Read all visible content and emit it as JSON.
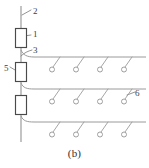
{
  "figure": {
    "caption": "(b)",
    "type": "schematic-line-diagram",
    "colors": {
      "line": "#9a9a9a",
      "valve_outline": "#4a4a4a",
      "label_text": "#3d3d3d",
      "background": "#ffffff"
    },
    "labels": [
      {
        "id": "2",
        "text": "2",
        "refers_to": "main-vertical-pipe-top"
      },
      {
        "id": "1",
        "text": "1",
        "refers_to": "upper-valve-box"
      },
      {
        "id": "3",
        "text": "3",
        "refers_to": "upper-branch-connection"
      },
      {
        "id": "5",
        "text": "5",
        "refers_to": "middle-valve-box"
      },
      {
        "id": "6",
        "text": "6",
        "refers_to": "emitter-hook"
      }
    ],
    "trunk": {
      "name": "main-vertical-line",
      "x": 21,
      "y_top": 6,
      "y_bottom": 142
    },
    "valves": [
      {
        "name": "valve-1",
        "x": 15,
        "y": 28,
        "width": 11,
        "height": 19
      },
      {
        "name": "valve-5",
        "x": 15,
        "y": 62,
        "width": 11,
        "height": 19
      },
      {
        "name": "valve-3rd",
        "x": 15,
        "y": 95,
        "width": 11,
        "height": 19
      }
    ],
    "branches": [
      {
        "name": "branch-upper",
        "y": 57,
        "x_start": 21,
        "x_end": 146,
        "emitter_count": 4,
        "emitters_x": [
          55,
          79,
          103,
          127
        ]
      },
      {
        "name": "branch-middle",
        "y": 89,
        "x_start": 21,
        "x_end": 146,
        "emitter_count": 4,
        "emitters_x": [
          55,
          79,
          103,
          127
        ]
      },
      {
        "name": "branch-lower",
        "y": 122,
        "x_start": 21,
        "x_end": 146,
        "emitter_count": 4,
        "emitters_x": [
          55,
          79,
          103,
          127
        ]
      }
    ]
  }
}
